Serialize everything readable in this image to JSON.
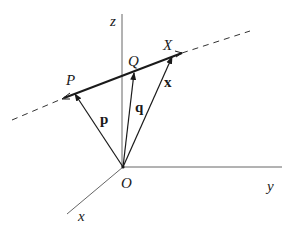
{
  "diagram": {
    "axes": {
      "z": "z",
      "y": "y",
      "x": "x",
      "origin": "O"
    },
    "points": {
      "P": "P",
      "Q": "Q",
      "X": "X"
    },
    "vectors": {
      "p": "p",
      "q": "q",
      "x": "x"
    },
    "colors": {
      "line": "#1a1a1a",
      "axis": "#555555",
      "background": "#ffffff"
    }
  }
}
